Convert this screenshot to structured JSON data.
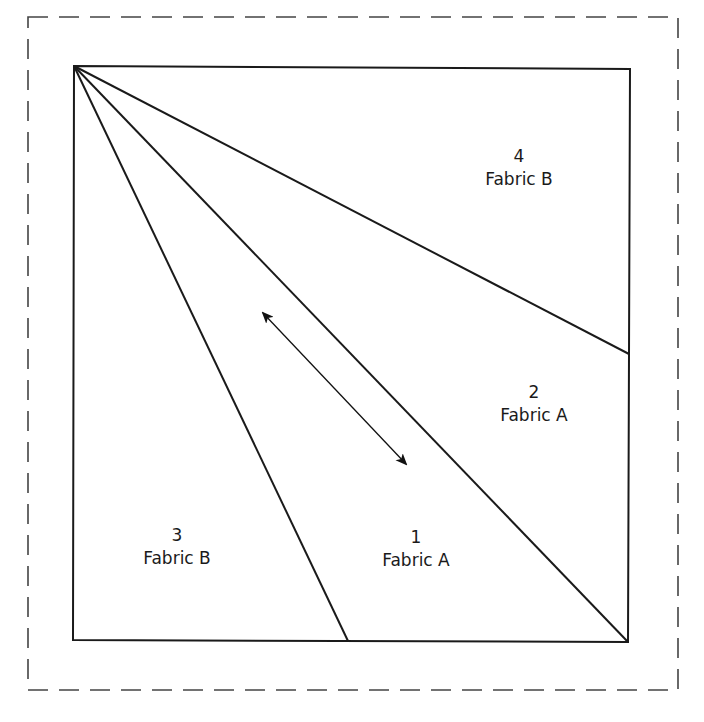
{
  "diagram": {
    "type": "quilt-block-foundation-piecing-pattern",
    "colors": {
      "line": "#1a1a1a",
      "dashed_border": "#444444",
      "background": "#ffffff"
    },
    "seam_allowance_border": {
      "style": "dashed",
      "x1": 28,
      "y1": 17,
      "x2": 678,
      "y2": 690
    },
    "block_square": {
      "corners": [
        [
          74,
          66
        ],
        [
          630,
          69
        ],
        [
          628,
          642
        ],
        [
          73,
          640
        ]
      ]
    },
    "seam_lines": [
      {
        "from": [
          74,
          66
        ],
        "to": [
          348,
          641
        ],
        "name": "seam-line-1-3"
      },
      {
        "from": [
          74,
          66
        ],
        "to": [
          628,
          642
        ],
        "name": "seam-line-1-2"
      },
      {
        "from": [
          74,
          66
        ],
        "to": [
          629,
          354
        ],
        "name": "seam-line-2-4"
      }
    ],
    "grain_arrow": {
      "from": [
        263,
        313
      ],
      "to": [
        406,
        464
      ],
      "double_headed": true
    },
    "pieces": [
      {
        "number": "1",
        "fabric": "Fabric A",
        "x": 416,
        "y": 526
      },
      {
        "number": "2",
        "fabric": "Fabric A",
        "x": 534,
        "y": 381
      },
      {
        "number": "3",
        "fabric": "Fabric B",
        "x": 177,
        "y": 524
      },
      {
        "number": "4",
        "fabric": "Fabric B",
        "x": 519,
        "y": 145
      }
    ]
  }
}
